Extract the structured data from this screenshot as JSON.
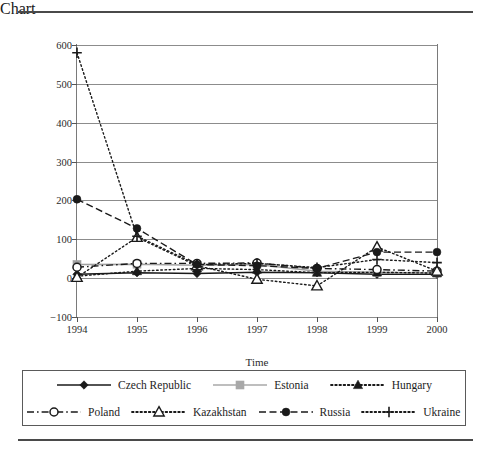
{
  "figure": {
    "ylabel": "Percentage change",
    "xlabel": "Time"
  },
  "chart_data": {
    "type": "line",
    "title": "",
    "xlabel": "Time",
    "ylabel": "Percentage change",
    "categories": [
      "1994",
      "1995",
      "1996",
      "1997",
      "1998",
      "1999",
      "2000"
    ],
    "x": [
      1994,
      1995,
      1996,
      1997,
      1998,
      1999,
      2000
    ],
    "ylim": [
      -100,
      600
    ],
    "yticks": [
      600,
      500,
      400,
      300,
      200,
      100,
      0,
      -100
    ],
    "ytick_labels": [
      "600",
      "500",
      "400",
      "300",
      "200",
      "100",
      "0",
      "−100"
    ],
    "grid": "horizontal",
    "legend_position": "below",
    "series": [
      {
        "name": "Czech Republic",
        "marker": "filled-diamond",
        "line": "solid",
        "color": "#1a1a1a",
        "values": [
          10,
          14,
          12,
          15,
          14,
          10,
          10
        ]
      },
      {
        "name": "Estonia",
        "marker": "filled-square",
        "line": "solid",
        "color": "#a0a0a0",
        "values": [
          35,
          36,
          33,
          35,
          18,
          15,
          13
        ]
      },
      {
        "name": "Hungary",
        "marker": "filled-triangle",
        "line": "dotted",
        "color": "#1a1a1a",
        "values": [
          5,
          18,
          25,
          22,
          14,
          15,
          13
        ]
      },
      {
        "name": "Poland",
        "marker": "open-circle",
        "line": "dash-dot",
        "color": "#1a1a1a",
        "values": [
          28,
          38,
          38,
          39,
          25,
          22,
          18
        ]
      },
      {
        "name": "Kazakhstan",
        "marker": "open-triangle",
        "line": "dotted",
        "color": "#1a1a1a",
        "values": [
          2,
          105,
          32,
          -3,
          -20,
          80,
          18
        ]
      },
      {
        "name": "Russia",
        "marker": "filled-circle",
        "line": "dashed",
        "color": "#1a1a1a",
        "values": [
          203,
          128,
          35,
          32,
          25,
          67,
          67
        ]
      },
      {
        "name": "Ukraine",
        "marker": "plus",
        "line": "dotted",
        "color": "#1a1a1a",
        "values": [
          580,
          108,
          35,
          38,
          27,
          48,
          40
        ]
      }
    ]
  },
  "legend": {
    "row1": [
      {
        "name": "Czech Republic",
        "key": "solid-diamond"
      },
      {
        "name": "Estonia",
        "key": "gray-solid-square"
      },
      {
        "name": "Hungary",
        "key": "dotted-triangle"
      }
    ],
    "row2": [
      {
        "name": "Poland",
        "key": "dashdot-open-circle"
      },
      {
        "name": "Kazakhstan",
        "key": "dotted-open-triangle"
      },
      {
        "name": "Russia",
        "key": "dashed-filled-circle"
      },
      {
        "name": "Ukraine",
        "key": "dotted-plus"
      }
    ]
  }
}
